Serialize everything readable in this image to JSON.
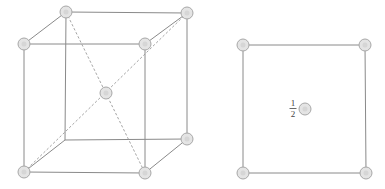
{
  "diagram": {
    "left_figure": {
      "type": "bcc-cube-3d",
      "vertices": {
        "back_top_left": [
          66,
          12
        ],
        "back_top_right": [
          187,
          13
        ],
        "front_top_left": [
          24,
          44
        ],
        "front_top_right": [
          145,
          44
        ],
        "back_bottom_left": [
          65,
          140
        ],
        "back_bottom_right": [
          187,
          139
        ],
        "front_bottom_left": [
          24,
          172
        ],
        "front_bottom_right": [
          145,
          173
        ],
        "body_center": [
          106,
          93
        ]
      }
    },
    "right_figure": {
      "type": "plan-view-projection",
      "corners": [
        [
          243,
          45
        ],
        [
          365,
          45
        ],
        [
          243,
          173
        ],
        [
          366,
          173
        ]
      ],
      "center_atom": [
        305,
        109
      ],
      "center_label": {
        "numerator": "1",
        "denominator": "2"
      }
    },
    "colors": {
      "edge": "#8a8a8a",
      "atom_fill": "#e4e4e4",
      "atom_stroke": "#a8a8a8"
    }
  }
}
